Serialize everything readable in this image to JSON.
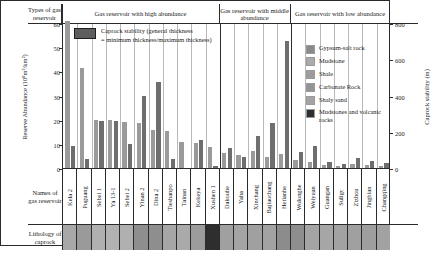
{
  "table": {
    "row_label_types": "Types of gas reservoir",
    "row_label_names": "Names of gas reservoir",
    "row_label_lithology": "Lithology of caprock"
  },
  "groups": [
    {
      "label": "Gas reservoir with  high abundance",
      "count": 11
    },
    {
      "label": "Gas reservoir with middle abundance",
      "count": 5
    },
    {
      "label": "Gas reservoir with low abundance",
      "count": 7
    }
  ],
  "legend_bar": {
    "line1": "Caprock stability (general thickness",
    "line2": "= minimum thickness/maximum thickness)",
    "swatch_color": "#5e5e5e"
  },
  "legend_lithology": {
    "items": [
      {
        "label": "Gypsum-salt rock",
        "color": "#8a8a8a"
      },
      {
        "label": "Mudstone",
        "color": "#ababab"
      },
      {
        "label": "Shale",
        "color": "#9d9d9d"
      },
      {
        "label": "Carbonate Rock",
        "color": "#949494"
      },
      {
        "label": "Shaly sand",
        "color": "#a4a4a4"
      },
      {
        "label": "Mudstones and volcanic rocks",
        "color": "#2e2e2e"
      }
    ]
  },
  "chart_data": {
    "type": "bar",
    "title": "",
    "ylabel": "Reserve Abundance (10⁸m³/km²)",
    "ylabel_right": "Caprock stability  (m)",
    "xlabel": "",
    "ylim": [
      0,
      60
    ],
    "yticks": [
      0,
      10,
      20,
      30,
      40,
      50,
      60
    ],
    "ylim_right": [
      0,
      800
    ],
    "yticks_right": [
      0,
      200,
      400,
      600,
      800
    ],
    "grid": false,
    "legend_position": "inside-top-left",
    "categories": [
      "Kela 2",
      "Puguang",
      "Sebei 1",
      "Ya 13-1",
      "Sebei 2",
      "Yinan 2",
      "Dina 2",
      "Tieshanpo",
      "Tainan",
      "Kekeya",
      "Xushen 1",
      "Dakouhe",
      "Yaha",
      "Xinchang",
      "Bajiaochang",
      "Hetianhe",
      "Wolonghe",
      "Weiyuan",
      "Guangan",
      "Suligc",
      "Zizhou",
      "Jingbian",
      "Changqing"
    ],
    "series": [
      {
        "name": "Reserve Abundance (10⁸m³/km²)",
        "axis": "left",
        "color": "#9a9a9a",
        "values": [
          61.0,
          41.5,
          20.0,
          19.8,
          19.0,
          18.6,
          15.8,
          15.2,
          10.8,
          10.2,
          8.8,
          6.4,
          5.2,
          7.0,
          4.4,
          5.6,
          3.4,
          2.6,
          1.3,
          0.9,
          1.5,
          1.2,
          1.0
        ]
      },
      {
        "name": "Caprock stability (m)",
        "axis": "right",
        "color": "#6e6e6e",
        "values": [
          123,
          48,
          262,
          262,
          131,
          400,
          477,
          52,
          0,
          157,
          13,
          112,
          60,
          176,
          248,
          700,
          88,
          124,
          34,
          20,
          55,
          38,
          30
        ]
      }
    ],
    "lithology": [
      "#a8a8a8",
      "#9a9a9a",
      "#b0b0b0",
      "#b2b2b2",
      "#b0b0b0",
      "#8e8e8e",
      "#8e8e8e",
      "#a6a6a6",
      "#aaaaaa",
      "#9c9c9c",
      "#2e2e2e",
      "#a0a0a0",
      "#a4a4a4",
      "#a0a0a0",
      "#a2a2a2",
      "#8c8c8c",
      "#8e8e8e",
      "#a4a4a4",
      "#a6a6a6",
      "#a2a2a2",
      "#a0a0a0",
      "#9e9e9e",
      "#a2a2a2"
    ]
  }
}
